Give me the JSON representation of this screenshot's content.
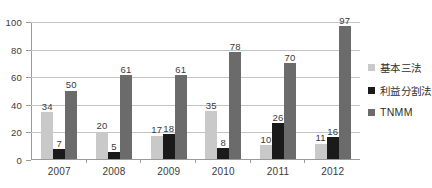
{
  "chart_data": {
    "type": "bar",
    "title": "",
    "subtitle": "",
    "xlabel": "",
    "ylabel": "",
    "categories": [
      "2007",
      "2008",
      "2009",
      "2010",
      "2011",
      "2012"
    ],
    "series": [
      {
        "name": "基本三法",
        "color": "#c9c9c9",
        "values": [
          34,
          20,
          17,
          35,
          10,
          11
        ]
      },
      {
        "name": "利益分割法",
        "color": "#1a1a1a",
        "values": [
          7,
          5,
          18,
          8,
          26,
          16
        ]
      },
      {
        "name": "TNMM",
        "color": "#6b6b6b",
        "values": [
          50,
          61,
          61,
          78,
          70,
          97
        ]
      }
    ],
    "ylim": [
      0,
      100
    ],
    "yticks": [
      "0",
      "20",
      "40",
      "60",
      "80",
      "100"
    ],
    "grid": true,
    "legend_position": "right",
    "data_labels": true,
    "annotations": []
  },
  "colors": {
    "axis": "#9a9a9a",
    "gridline": "#c4c4c4",
    "text": "#3a3a3a",
    "background": "#ffffff"
  }
}
